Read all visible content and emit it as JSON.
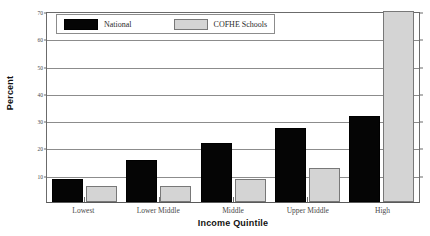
{
  "chart_data": {
    "type": "bar",
    "title": "",
    "xlabel": "Income Quintile",
    "ylabel": "Percent",
    "categories": [
      "Lowest",
      "Lower Middle",
      "Middle",
      "Upper Middle",
      "High"
    ],
    "series": [
      {
        "name": "National",
        "values": [
          8.5,
          15.5,
          21.5,
          27,
          31.5
        ],
        "color": "#050505"
      },
      {
        "name": "COFHE Schools",
        "values": [
          6,
          6,
          8.5,
          12.5,
          74
        ],
        "color": "#d4d4d4"
      }
    ],
    "ylim": [
      0,
      70
    ],
    "yticks": [
      10,
      20,
      30,
      40,
      50,
      60,
      70
    ],
    "ytick_labels": [
      "10",
      "20",
      "30",
      "40",
      "50",
      "60",
      "70"
    ],
    "grid": true,
    "legend_position": "top-left"
  },
  "legend": {
    "entries": [
      {
        "label": "National",
        "swatch": "national"
      },
      {
        "label": "COFHE Schools",
        "swatch": "cofhe"
      }
    ]
  },
  "axes": {
    "y_title": "Percent",
    "x_title": "Income Quintile"
  }
}
